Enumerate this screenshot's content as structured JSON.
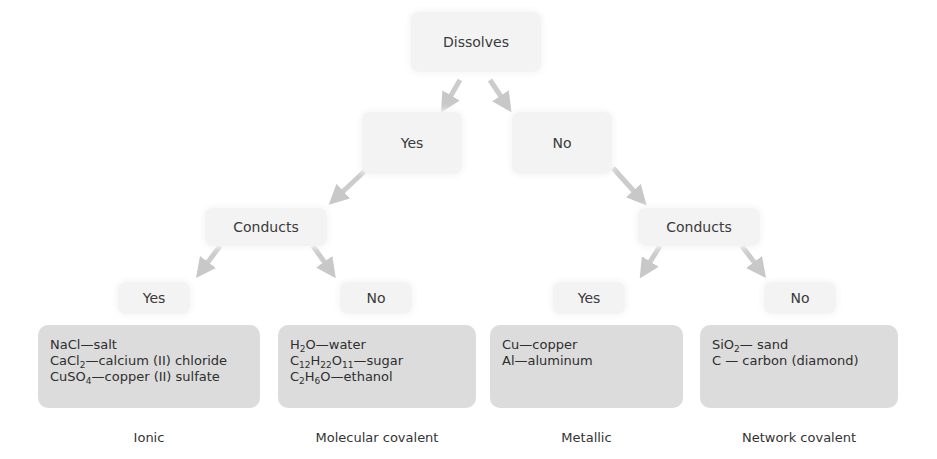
{
  "root": {
    "label": "Dissolves"
  },
  "level1": {
    "yes": "Yes",
    "no": "No"
  },
  "level2": {
    "left_conducts": "Conducts",
    "right_conducts": "Conducts"
  },
  "level3": {
    "ll_yes": "Yes",
    "lr_no": "No",
    "rl_yes": "Yes",
    "rr_no": "No"
  },
  "groups": [
    {
      "category": "Ionic",
      "items": [
        {
          "formula_parts": [
            "NaCl"
          ],
          "name": "—salt"
        },
        {
          "formula_parts": [
            "CaCl",
            "2"
          ],
          "name": "—calcium (II) chloride"
        },
        {
          "formula_parts": [
            "CuSO",
            "4"
          ],
          "name": "—copper (II) sulfate"
        }
      ]
    },
    {
      "category": "Molecular covalent",
      "items": [
        {
          "formula_parts": [
            "H",
            "2",
            "O"
          ],
          "name": "—water"
        },
        {
          "formula_parts": [
            "C",
            "12",
            "H",
            "22",
            "O",
            "11"
          ],
          "name": "—sugar"
        },
        {
          "formula_parts": [
            "C",
            "2",
            "H",
            "6",
            "O"
          ],
          "name": "—ethanol"
        }
      ]
    },
    {
      "category": "Metallic",
      "items": [
        {
          "formula_parts": [
            "Cu"
          ],
          "name": "—copper"
        },
        {
          "formula_parts": [
            "Al"
          ],
          "name": "—aluminum"
        }
      ]
    },
    {
      "category": "Network covalent",
      "items": [
        {
          "formula_parts": [
            "SiO",
            "2"
          ],
          "name": "— sand"
        },
        {
          "formula_parts": [
            "C"
          ],
          "name": "— carbon (diamond)"
        }
      ]
    }
  ],
  "text": {
    "g0": [
      "NaCl",
      "—salt"
    ],
    "g0b": [
      "CaCl",
      "2",
      "—calcium (II) chloride"
    ],
    "g0c": [
      "CuSO",
      "4",
      "—copper (II) sulfate"
    ],
    "g1a": [
      "H",
      "2",
      "O—water"
    ],
    "g1b": [
      "C",
      "12",
      "H",
      "22",
      "O",
      "11",
      "—sugar"
    ],
    "g1c": [
      "C",
      "2",
      "H",
      "6",
      "O—ethanol"
    ],
    "g2a": "Cu—copper",
    "g2b": "Al—aluminum",
    "g3a": [
      "SiO",
      "2",
      "— sand"
    ],
    "g3b": "C — carbon (diamond)"
  },
  "colors": {
    "node_bg": "#f3f3f3",
    "leaf_bg": "#dcdcdc",
    "arrow": "#c8c8c8",
    "text": "#333333"
  }
}
